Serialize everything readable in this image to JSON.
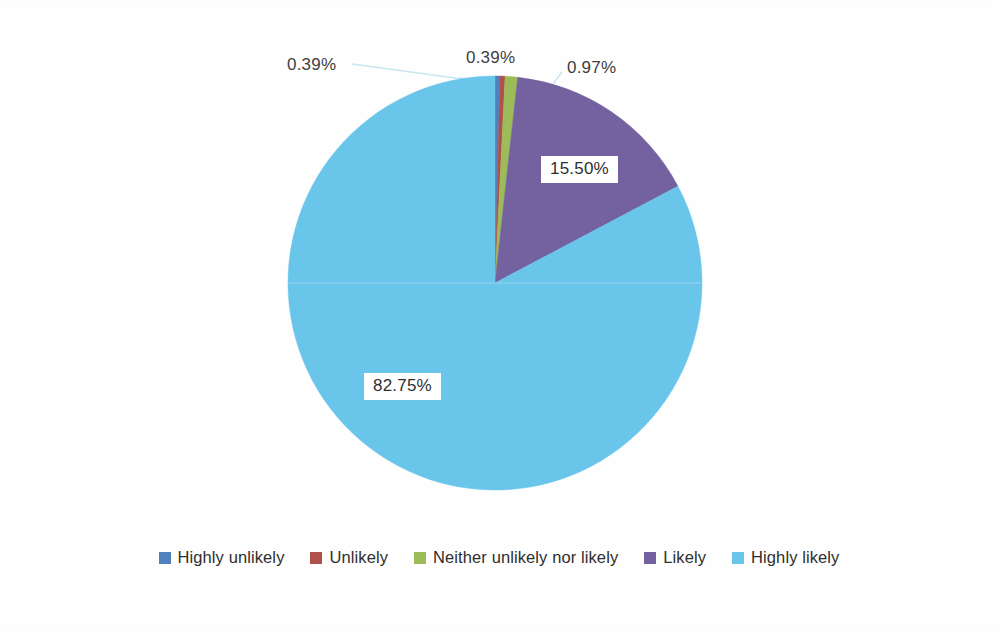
{
  "chart_data": {
    "type": "pie",
    "title": "",
    "subtitle": "",
    "xlabel": "",
    "ylabel": "",
    "grid": false,
    "legend_position": "bottom",
    "start_angle_deg": 0,
    "direction": "clockwise",
    "center": {
      "x": 495,
      "y": 283
    },
    "radius": 207,
    "categories": [
      "Highly unlikely",
      "Unlikely",
      "Neither unlikely nor likely",
      "Likely",
      "Highly likely"
    ],
    "values": [
      0.39,
      0.39,
      0.97,
      15.5,
      82.75
    ],
    "value_labels": [
      "0.39%",
      "0.39%",
      "0.97%",
      "15.50%",
      "82.75%"
    ],
    "colors": [
      "#4f81bd",
      "#b0504a",
      "#9cbb59",
      "#7361a0",
      "#69c6ea"
    ],
    "series": [
      {
        "name": "Likelihood",
        "values": [
          0.39,
          0.39,
          0.97,
          15.5,
          82.75
        ]
      }
    ],
    "annotations": [
      {
        "text": "0.39%",
        "slice": "Highly unlikely",
        "placement": "outside-leader-left"
      },
      {
        "text": "0.39%",
        "slice": "Unlikely",
        "placement": "outside-leader-top"
      },
      {
        "text": "0.97%",
        "slice": "Neither unlikely nor likely",
        "placement": "outside-leader-right"
      },
      {
        "text": "15.50%",
        "slice": "Likely",
        "placement": "inside-boxed"
      },
      {
        "text": "82.75%",
        "slice": "Highly likely",
        "placement": "inside-boxed"
      }
    ]
  },
  "labels": {
    "callout_highly_unlikely": "0.39%",
    "callout_unlikely": "0.39%",
    "callout_neither": "0.97%",
    "inner_likely": "15.50%",
    "inner_highly_likely": "82.75%"
  },
  "legend": {
    "items": [
      {
        "label": "Highly unlikely",
        "color": "#4f81bd"
      },
      {
        "label": "Unlikely",
        "color": "#b0504a"
      },
      {
        "label": "Neither unlikely nor likely",
        "color": "#9cbb59"
      },
      {
        "label": "Likely",
        "color": "#7361a0"
      },
      {
        "label": "Highly likely",
        "color": "#69c6ea"
      }
    ]
  },
  "leader_color": "#c7e6f2"
}
